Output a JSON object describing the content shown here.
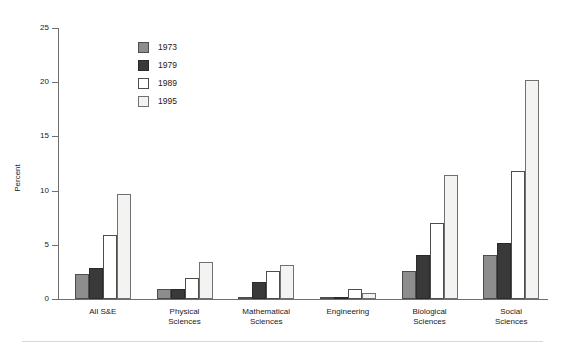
{
  "chart_data": {
    "type": "bar",
    "title": "",
    "subtitle": "",
    "xlabel": "",
    "ylabel": "Percent",
    "ylim": [
      0,
      25
    ],
    "yticks": [
      0,
      5,
      10,
      15,
      20,
      25
    ],
    "ytick_labels": [
      "0",
      "5",
      "10",
      "15",
      "20",
      "25"
    ],
    "grid": false,
    "legend_position": "upper-left-inside",
    "categories": [
      "All S&E",
      "Physical\nSciences",
      "Mathematical\nSciences",
      "Engineering",
      "Biological\nSciences",
      "Social\nSciences"
    ],
    "category_labels": [
      [
        "All S&E"
      ],
      [
        "Physical",
        "Sciences"
      ],
      [
        "Mathematical",
        "Sciences"
      ],
      [
        "Engineering"
      ],
      [
        "Biological",
        "Sciences"
      ],
      [
        "Social",
        "Sciences"
      ]
    ],
    "series": [
      {
        "name": "1973",
        "color": "#8d8d8d",
        "values": [
          2.3,
          0.9,
          0.15,
          0.1,
          2.6,
          4.1
        ]
      },
      {
        "name": "1979",
        "color": "#393939",
        "values": [
          2.9,
          0.9,
          1.6,
          0.15,
          4.1,
          5.2
        ]
      },
      {
        "name": "1989",
        "color": "#ffffff",
        "values": [
          5.9,
          1.9,
          2.6,
          0.9,
          7.0,
          11.8
        ]
      },
      {
        "name": "1995",
        "color": "#f3f3f1",
        "values": [
          9.7,
          3.4,
          3.1,
          0.6,
          11.4,
          20.2
        ]
      }
    ]
  },
  "axis": {
    "y_title": "Percent"
  },
  "legend": {
    "items": [
      {
        "label": "1973"
      },
      {
        "label": "1979"
      },
      {
        "label": "1989"
      },
      {
        "label": "1995"
      }
    ]
  }
}
